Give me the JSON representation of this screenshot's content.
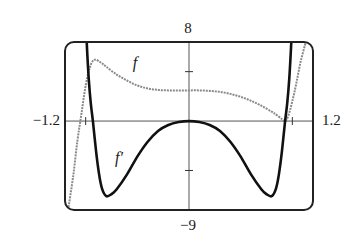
{
  "chart_data": {
    "type": "line",
    "title": "",
    "xlabel": "",
    "ylabel": "",
    "xlim": [
      -1.2,
      1.2
    ],
    "ylim": [
      -9,
      8
    ],
    "window_labels": {
      "x_min": "−1.2",
      "x_max": "1.2",
      "y_max": "8",
      "y_min": "−9"
    },
    "ticks": {
      "x": [
        -1,
        1
      ],
      "y": [
        -5,
        5
      ]
    },
    "grid": false,
    "legend": "inline curve labels",
    "series": [
      {
        "name": "f",
        "label": "f",
        "style": "gray dotted",
        "color": "#8a8a8a",
        "x": [
          -1.17,
          -1.12,
          -1.08,
          -1.04,
          -1.0,
          -0.96,
          -0.93,
          -0.9,
          -0.85,
          -0.8,
          -0.7,
          -0.6,
          -0.5,
          -0.4,
          -0.3,
          -0.2,
          -0.1,
          0.0,
          0.1,
          0.2,
          0.3,
          0.4,
          0.5,
          0.6,
          0.7,
          0.8,
          0.85,
          0.9,
          0.93,
          0.96,
          1.0,
          1.04,
          1.08,
          1.13
        ],
        "y": [
          -9.0,
          -5.5,
          -2.0,
          0.8,
          3.6,
          5.4,
          6.1,
          6.2,
          5.9,
          5.5,
          4.7,
          4.1,
          3.6,
          3.3,
          3.15,
          3.1,
          3.1,
          3.1,
          3.1,
          3.05,
          2.95,
          2.75,
          2.45,
          2.05,
          1.55,
          0.95,
          0.6,
          0.2,
          0.0,
          0.5,
          2.0,
          3.9,
          6.0,
          8.0
        ]
      },
      {
        "name": "f'",
        "label": "f′",
        "style": "black solid thick",
        "color": "#111111",
        "x": [
          -0.99,
          -0.97,
          -0.95,
          -0.93,
          -0.9,
          -0.87,
          -0.84,
          -0.8,
          -0.75,
          -0.7,
          -0.6,
          -0.5,
          -0.4,
          -0.3,
          -0.2,
          -0.1,
          0.0,
          0.1,
          0.2,
          0.3,
          0.4,
          0.5,
          0.6,
          0.7,
          0.75,
          0.8,
          0.84,
          0.87,
          0.9,
          0.93,
          0.95,
          0.97,
          0.99
        ],
        "y": [
          8.0,
          4.2,
          1.8,
          0.0,
          -3.0,
          -5.4,
          -6.9,
          -7.6,
          -7.4,
          -6.9,
          -5.4,
          -3.6,
          -2.1,
          -1.0,
          -0.4,
          -0.1,
          0.0,
          -0.1,
          -0.4,
          -1.0,
          -2.1,
          -3.6,
          -5.4,
          -6.9,
          -7.4,
          -7.6,
          -6.9,
          -5.4,
          -3.0,
          0.0,
          1.8,
          4.2,
          8.0
        ]
      }
    ],
    "annotations": [
      {
        "text": "f",
        "x": -0.52,
        "y": 5.8
      },
      {
        "text": "f′",
        "x": -0.68,
        "y": -3.8
      }
    ]
  },
  "labels": {
    "x_min": "−1.2",
    "x_max": "1.2",
    "y_max": "8",
    "y_min": "−9",
    "f": "f",
    "f_prime": "f′"
  }
}
